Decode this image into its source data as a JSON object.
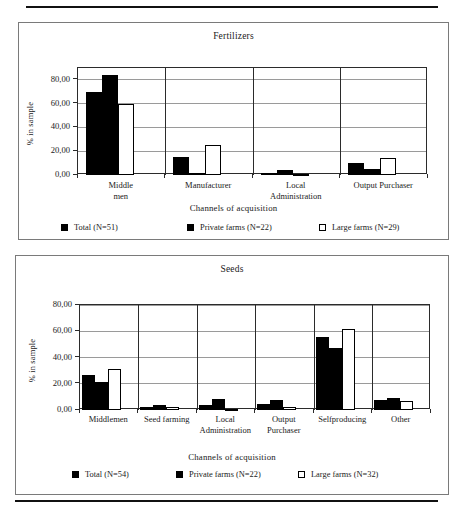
{
  "page": {
    "background": "#ffffff",
    "rule_color": "#111111",
    "panel_border_color": "#7a7a7a"
  },
  "chart_data": [
    {
      "id": "fertilizers",
      "type": "bar",
      "title": "Fertilizers",
      "xlabel": "Channels of acquisition",
      "ylabel": "% in sample",
      "ylim": [
        0,
        90
      ],
      "ytick_values": [
        0,
        20,
        40,
        60,
        80
      ],
      "ytick_labels": [
        "0,00",
        "20,00",
        "40,00",
        "60,00",
        "80,00"
      ],
      "grid": true,
      "legend_position": "bottom",
      "categories": [
        "Middle\nmen",
        "Manufacturer",
        "Local\nAdministration",
        "Output Purchaser"
      ],
      "series": [
        {
          "name": "Total (N=51)",
          "style": "solid",
          "values": [
            70.0,
            15.0,
            2.0,
            10.0
          ]
        },
        {
          "name": "Private farms (N=22)",
          "style": "solid",
          "values": [
            84.0,
            2.0,
            4.5,
            5.0
          ]
        },
        {
          "name": "Large farms (N=29)",
          "style": "hollow",
          "values": [
            60.0,
            25.0,
            0.5,
            14.0
          ]
        }
      ]
    },
    {
      "id": "seeds",
      "type": "bar",
      "title": "Seeds",
      "xlabel": "Channels of acquisition",
      "ylabel": "% in sample",
      "ylim": [
        0,
        80
      ],
      "ytick_values": [
        0,
        20,
        40,
        60,
        80
      ],
      "ytick_labels": [
        "0,00",
        "20,00",
        "40,00",
        "60,00",
        "80,00"
      ],
      "grid": true,
      "legend_position": "bottom",
      "categories": [
        "Middlemen",
        "Seed farming",
        "Local\nAdministration",
        "Output\nPurchaser",
        "Selfproducing",
        "Other"
      ],
      "series": [
        {
          "name": "Total (N=54)",
          "style": "solid",
          "values": [
            27.0,
            2.5,
            3.5,
            4.5,
            56.0,
            8.0
          ]
        },
        {
          "name": "Private farms (N=22)",
          "style": "solid",
          "values": [
            21.0,
            3.5,
            8.5,
            7.5,
            47.0,
            9.5
          ]
        },
        {
          "name": "Large farms (N=32)",
          "style": "hollow",
          "values": [
            31.0,
            2.0,
            0.4,
            2.0,
            61.5,
            7.0
          ]
        }
      ]
    }
  ]
}
